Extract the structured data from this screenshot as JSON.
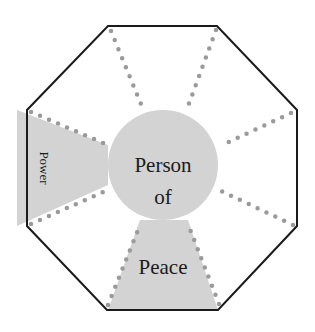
{
  "diagram": {
    "type": "octagon-spoke",
    "center_label": [
      "Person",
      "of",
      "Peace"
    ],
    "wedge_labels": {
      "left": "Power"
    },
    "colors": {
      "outline": "#1a1a1a",
      "fill": "#d3d3d3",
      "dots": "#9a9a9a",
      "background": "#ffffff"
    }
  }
}
